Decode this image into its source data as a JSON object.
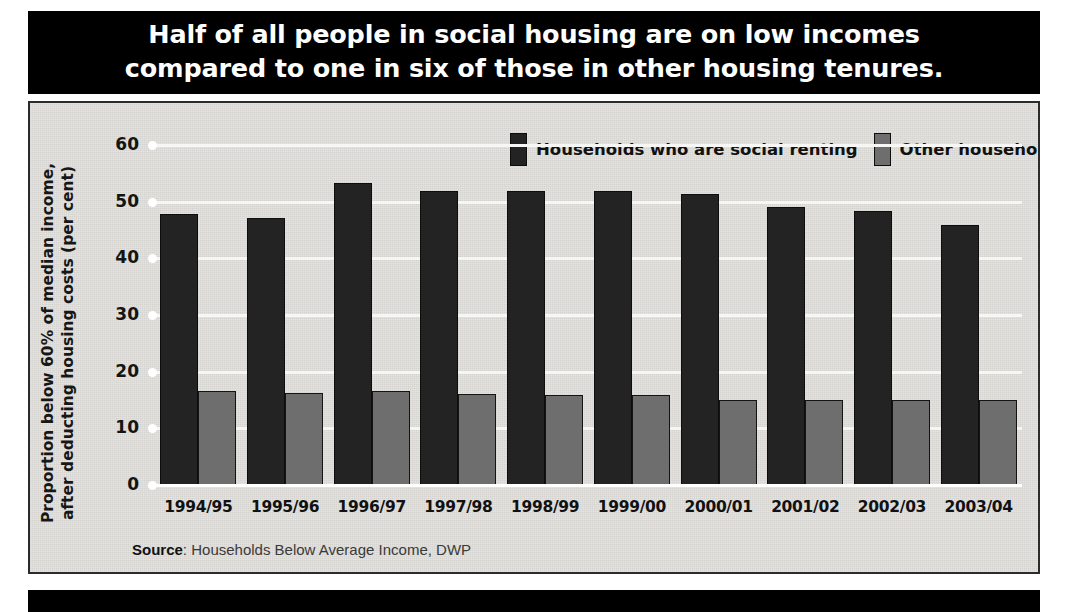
{
  "header": {
    "line1": "Half of all people in social housing are on low incomes",
    "line2": "compared to one in six of those in other housing tenures."
  },
  "legend": {
    "items": [
      {
        "label": "Households who are social renting",
        "color": "#232323"
      },
      {
        "label": "Other households",
        "color": "#6e6e6e"
      }
    ]
  },
  "source": {
    "prefix": "Source",
    "separator": ": ",
    "text": "Households Below Average Income, DWP"
  },
  "chart_data": {
    "type": "bar",
    "title": "Half of all people in social housing are on low incomes compared to one in six of those in other housing tenures.",
    "xlabel": "",
    "ylabel": "Proportion below 60% of median income, after deducting housing costs (per cent)",
    "ylim": [
      0,
      60
    ],
    "yticks": [
      0,
      10,
      20,
      30,
      40,
      50,
      60
    ],
    "ytick_labels": [
      "0",
      "10",
      "20",
      "30",
      "40",
      "50",
      "60"
    ],
    "grid": true,
    "legend_position": "top-center",
    "categories": [
      "1994/95",
      "1995/96",
      "1996/97",
      "1997/98",
      "1998/99",
      "1999/00",
      "2000/01",
      "2001/02",
      "2002/03",
      "2003/04"
    ],
    "series": [
      {
        "name": "Households who are social renting",
        "color": "#232323",
        "values": [
          48.2,
          47.4,
          53.7,
          52.2,
          52.3,
          52.2,
          51.7,
          49.4,
          48.7,
          46.2
        ]
      },
      {
        "name": "Other households",
        "color": "#6e6e6e",
        "values": [
          17.0,
          16.6,
          16.9,
          16.4,
          16.3,
          16.3,
          15.4,
          15.3,
          15.4,
          15.3
        ]
      }
    ]
  }
}
